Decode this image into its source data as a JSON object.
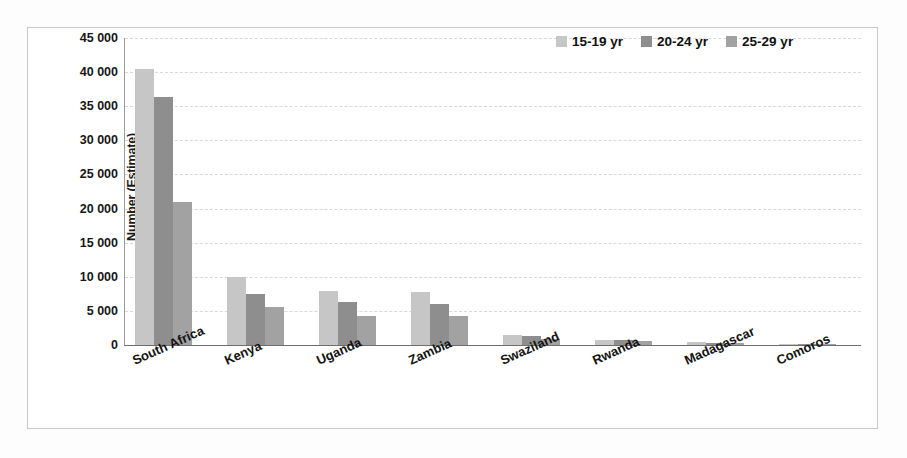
{
  "chart_data": {
    "type": "bar",
    "title": "",
    "xlabel": "",
    "ylabel": "Number (Estimate)",
    "ylim": [
      0,
      45000
    ],
    "ytick_values": [
      0,
      5000,
      10000,
      15000,
      20000,
      25000,
      30000,
      35000,
      40000,
      45000
    ],
    "ytick_labels": [
      "0",
      "5 000",
      "10 000",
      "15 000",
      "20 000",
      "25 000",
      "30 000",
      "35 000",
      "40 000",
      "45 000"
    ],
    "grid": true,
    "legend_position": "top-right",
    "categories": [
      "South Africa",
      "Kenya",
      "Uganda",
      "Zambia",
      "Swaziland",
      "Rwanda",
      "Madagascar",
      "Comoros"
    ],
    "series": [
      {
        "name": "15-19 yr",
        "color": "#c6c6c6",
        "values": [
          40500,
          9900,
          7900,
          7700,
          1400,
          700,
          400,
          90
        ]
      },
      {
        "name": "20-24 yr",
        "color": "#8e8e8e",
        "values": [
          36300,
          7500,
          6300,
          6000,
          1300,
          800,
          300,
          70
        ]
      },
      {
        "name": "25-29 yr",
        "color": "#a2a2a2",
        "values": [
          21000,
          5500,
          4200,
          4300,
          900,
          600,
          250,
          50
        ]
      }
    ]
  },
  "legend": {
    "items": [
      {
        "label": "15-19 yr",
        "color": "#c6c6c6"
      },
      {
        "label": "20-24 yr",
        "color": "#8e8e8e"
      },
      {
        "label": "25-29 yr",
        "color": "#a2a2a2"
      }
    ]
  }
}
